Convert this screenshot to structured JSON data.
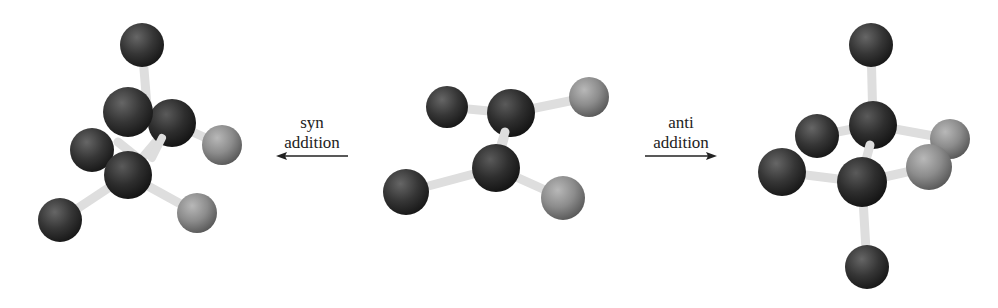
{
  "figure": {
    "colors": {
      "background": "#ffffff",
      "carbon": "#2b2b2b",
      "dark_substituent": "#333333",
      "light_substituent": "#8a8a8a",
      "bond": "#e2e2e2",
      "arrow": "#222222"
    }
  },
  "labels": {
    "syn": {
      "line1": "syn",
      "line2": "addition"
    },
    "anti": {
      "line1": "anti",
      "line2": "addition"
    }
  },
  "arrows": {
    "syn": {
      "direction": "left"
    },
    "anti": {
      "direction": "right"
    }
  },
  "models": {
    "syn_product": {
      "name": "syn addition product",
      "atoms": [
        {
          "id": "top",
          "type": "dark",
          "x": 142,
          "y": 45,
          "r": 22
        },
        {
          "id": "c_back",
          "type": "carbon",
          "x": 172,
          "y": 123,
          "r": 24
        },
        {
          "id": "front_left",
          "type": "dark",
          "x": 128,
          "y": 112,
          "r": 25
        },
        {
          "id": "left_mid",
          "type": "dark",
          "x": 92,
          "y": 150,
          "r": 22
        },
        {
          "id": "c_front",
          "type": "carbon",
          "x": 128,
          "y": 175,
          "r": 24
        },
        {
          "id": "right_gray",
          "type": "light",
          "x": 222,
          "y": 145,
          "r": 20
        },
        {
          "id": "bottom_left",
          "type": "dark",
          "x": 60,
          "y": 220,
          "r": 22
        },
        {
          "id": "bottom_right",
          "type": "light",
          "x": 197,
          "y": 213,
          "r": 20
        }
      ]
    },
    "alkene": {
      "name": "alkene reactant",
      "atoms": [
        {
          "id": "top_left",
          "type": "dark",
          "x": 447,
          "y": 107,
          "r": 21
        },
        {
          "id": "c_upper",
          "type": "carbon",
          "x": 511,
          "y": 113,
          "r": 24
        },
        {
          "id": "top_right",
          "type": "light",
          "x": 589,
          "y": 97,
          "r": 20
        },
        {
          "id": "c_lower",
          "type": "carbon",
          "x": 496,
          "y": 168,
          "r": 24
        },
        {
          "id": "bottom_left",
          "type": "dark",
          "x": 406,
          "y": 192,
          "r": 23
        },
        {
          "id": "bottom_right",
          "type": "light",
          "x": 563,
          "y": 198,
          "r": 22
        }
      ]
    },
    "anti_product": {
      "name": "anti addition product",
      "atoms": [
        {
          "id": "top",
          "type": "dark",
          "x": 871,
          "y": 45,
          "r": 22
        },
        {
          "id": "left_back",
          "type": "dark",
          "x": 817,
          "y": 136,
          "r": 22
        },
        {
          "id": "right_back",
          "type": "light",
          "x": 950,
          "y": 139,
          "r": 20
        },
        {
          "id": "c_upper",
          "type": "carbon",
          "x": 873,
          "y": 125,
          "r": 24
        },
        {
          "id": "left_front",
          "type": "dark",
          "x": 782,
          "y": 172,
          "r": 24
        },
        {
          "id": "c_lower",
          "type": "carbon",
          "x": 862,
          "y": 182,
          "r": 25
        },
        {
          "id": "right_front",
          "type": "light",
          "x": 929,
          "y": 167,
          "r": 23
        },
        {
          "id": "bottom",
          "type": "dark",
          "x": 867,
          "y": 267,
          "r": 22
        }
      ]
    }
  }
}
